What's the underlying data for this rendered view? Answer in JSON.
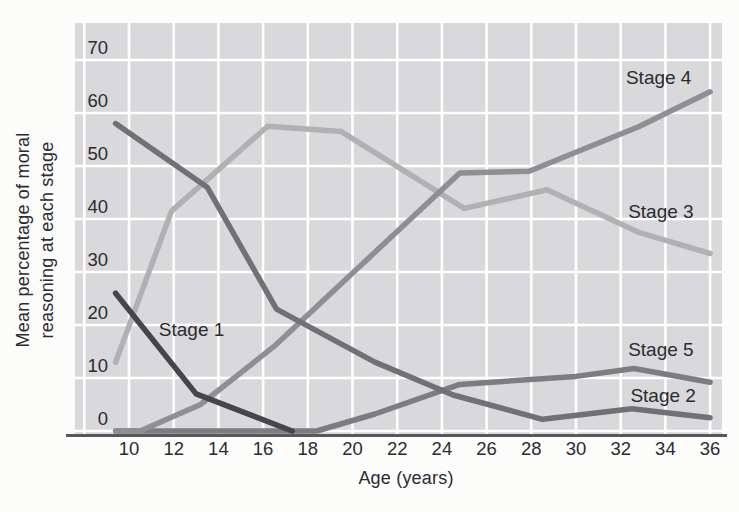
{
  "chart_data": {
    "type": "line",
    "title": "",
    "xlabel": "Age (years)",
    "ylabel": "Mean percentage of moral reasoning at each stage",
    "ylabel_lines": [
      "Mean percentage of moral",
      "reasoning at each stage"
    ],
    "x_ticks": [
      10,
      12,
      14,
      16,
      18,
      20,
      22,
      24,
      26,
      28,
      30,
      32,
      34,
      36
    ],
    "y_ticks": [
      0,
      10,
      20,
      30,
      40,
      50,
      60,
      70
    ],
    "xlim": [
      7.6,
      36.5
    ],
    "ylim": [
      0,
      77
    ],
    "grid": true,
    "legend_position": "inline-labels",
    "colors": {
      "plot_background": "#d9d9db",
      "gridline": "#ffffff",
      "axis_line": "#57575c",
      "text": "#2b2b30"
    },
    "series": [
      {
        "name": "Stage 1",
        "color": "#45454b",
        "points": [
          [
            9.4,
            26
          ],
          [
            13.0,
            7
          ],
          [
            17.3,
            0
          ]
        ],
        "label_at": [
          12.8,
          19
        ]
      },
      {
        "name": "Stage 2",
        "color": "#707076",
        "points": [
          [
            9.4,
            58
          ],
          [
            13.5,
            46
          ],
          [
            16.6,
            23
          ],
          [
            21.0,
            13
          ],
          [
            24.5,
            6.8
          ],
          [
            28.5,
            2.2
          ],
          [
            32.5,
            4.2
          ],
          [
            36.0,
            2.5
          ]
        ],
        "label_at": [
          33.9,
          6.6
        ]
      },
      {
        "name": "Stage 3",
        "color": "#b1b1b4",
        "points": [
          [
            9.4,
            13
          ],
          [
            11.9,
            41.5
          ],
          [
            16.2,
            57.5
          ],
          [
            19.5,
            56.5
          ],
          [
            25.0,
            42
          ],
          [
            28.7,
            45.5
          ],
          [
            32.8,
            37.5
          ],
          [
            36.0,
            33.5
          ]
        ],
        "label_at": [
          33.8,
          41.3
        ]
      },
      {
        "name": "Stage 4",
        "color": "#8e8e93",
        "points": [
          [
            9.4,
            0
          ],
          [
            10.5,
            0
          ],
          [
            13.2,
            5
          ],
          [
            16.5,
            16
          ],
          [
            24.8,
            48.7
          ],
          [
            27.9,
            49
          ],
          [
            32.8,
            57.4
          ],
          [
            36.0,
            64
          ]
        ],
        "label_at": [
          33.7,
          66.6
        ]
      },
      {
        "name": "Stage 5",
        "color": "#7c7c82",
        "points": [
          [
            9.4,
            0
          ],
          [
            18.4,
            0
          ],
          [
            21.0,
            3.2
          ],
          [
            24.8,
            8.8
          ],
          [
            30.0,
            10.3
          ],
          [
            32.6,
            11.8
          ],
          [
            36.0,
            9.2
          ]
        ],
        "label_at": [
          33.8,
          15.3
        ]
      }
    ],
    "draw_order": [
      "Stage 3",
      "Stage 5",
      "Stage 4",
      "Stage 2",
      "Stage 1"
    ]
  }
}
